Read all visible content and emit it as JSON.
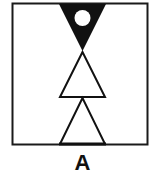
{
  "figure": {
    "label": "A",
    "frame": {
      "stroke": "#1a1a1a"
    },
    "shapes": [
      {
        "type": "inverted-triangle",
        "fill": "#111111",
        "contains": "white-circle"
      },
      {
        "type": "upright-triangle",
        "fill": "#ffffff",
        "stroke": "#111111"
      },
      {
        "type": "upright-triangle",
        "fill": "#ffffff",
        "stroke": "#111111"
      }
    ]
  }
}
